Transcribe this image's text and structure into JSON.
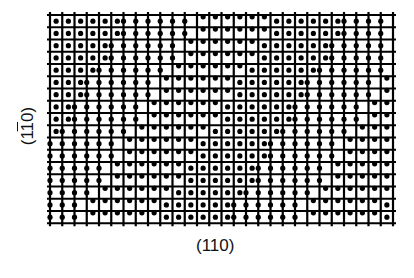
{
  "figure": {
    "x_axis_label": "(110)",
    "y_axis_label_parts": [
      "(1",
      "1",
      "0)"
    ],
    "y_axis_label_text": "(1̄0)",
    "grid": {
      "left": 50,
      "top": 15,
      "cols": 28,
      "rows": 17,
      "cell": 12.25,
      "line_color": "#000000",
      "line_width": 2.2,
      "dot_radius": 2.6,
      "dot_color": "#000000"
    }
  }
}
